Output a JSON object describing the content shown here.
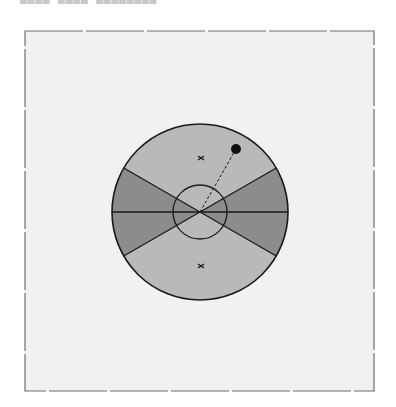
{
  "header": {
    "title_clipped": "▄▄▄▄ ▄▄▄▄ ▄▄▄▄▄▄▄▄"
  },
  "colors": {
    "page_bg": "#ffffff",
    "frame_bg": "#f1f1f1",
    "frame_border": "#6e6e6e",
    "light_sector": "#b9b9b9",
    "dark_sector": "#8c8c8c",
    "outline": "#1a1a1a"
  },
  "frame": {
    "x": 25,
    "y": 31,
    "width": 349,
    "height": 360,
    "dash_segment": 58,
    "dash_gap": 3
  },
  "diagram": {
    "center": {
      "x": 200,
      "y": 212
    },
    "outer_radius": 88,
    "inner_radius": 27,
    "wedge_half_angle_deg": 30,
    "markers": [
      {
        "type": "cross",
        "x": 201,
        "y": 158
      },
      {
        "type": "cross",
        "x": 201,
        "y": 266
      }
    ],
    "point": {
      "x": 236,
      "y": 149,
      "radius": 5
    }
  }
}
